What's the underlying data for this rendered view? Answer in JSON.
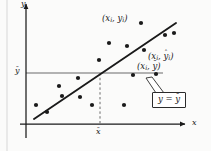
{
  "figure": {
    "kind": "scatterplot-with-regression-line",
    "background": "#fbfbfa",
    "ink": "#1a1a1a",
    "rule_gray": "#9a9a9a"
  },
  "axes": {
    "x_label": "x",
    "y_label": "y",
    "x_tick_label": "x",
    "x_tick_overline": "¯",
    "y_tick_label": "y",
    "y_tick_overline": "¯"
  },
  "annotations": {
    "observed_point": {
      "open": "(",
      "x": "x",
      "xsub": "i",
      "comma": ", ",
      "y": "y",
      "ysub": "i",
      "close": ")"
    },
    "predicted_point": {
      "open": "(",
      "x": "x",
      "xsub": "i",
      "comma": ", ",
      "y": "y",
      "ymark": "ˆ",
      "ysub": "i",
      "close": ")"
    },
    "mean_point": {
      "open": "(",
      "x": "x",
      "xsub": "i",
      "comma": ", ",
      "y": "y",
      "ymark": "¯",
      "close": ")"
    },
    "mean_line_box": {
      "lhs": "y",
      "eq": " = ",
      "rhs": "y",
      "rhs_mark": "¯"
    }
  },
  "chart_data": {
    "type": "scatter",
    "title": "",
    "xlabel": "x",
    "ylabel": "y",
    "grid": false,
    "legend": null,
    "xlim": [
      0,
      211
    ],
    "ylim": [
      0,
      151
    ],
    "note": "Coordinates are in screenshot pixel space; y increases downward.",
    "series": [
      {
        "name": "data points",
        "marker": "filled-circle",
        "color": "#1a1a1a",
        "radius": 2.1,
        "points": [
          [
            36,
            105
          ],
          [
            47,
            112
          ],
          [
            59,
            86
          ],
          [
            62,
            96
          ],
          [
            78,
            78
          ],
          [
            80,
            97
          ],
          [
            92,
            105
          ],
          [
            99,
            60
          ],
          [
            109,
            43
          ],
          [
            124,
            105
          ],
          [
            127,
            46
          ],
          [
            133,
            75
          ],
          [
            141,
            23
          ],
          [
            144,
            50
          ],
          [
            156,
            74
          ],
          [
            165,
            35
          ],
          [
            174,
            33
          ]
        ]
      }
    ],
    "regression_line": {
      "name": "least squares line",
      "color": "#1a1a1a",
      "width": 1.9,
      "x0": 34,
      "y0": 119,
      "x1": 176,
      "y1": 23
    },
    "mean_y_line": {
      "name": "y = y-bar",
      "color": "#9a9a9a",
      "width": 1.6,
      "x0": 26,
      "y0": 73,
      "x1": 163,
      "y1": 73
    },
    "mean_x_line": {
      "name": "x = x-bar (dashed)",
      "color": "#6a6a6a",
      "dash": "2.4 2.4",
      "x": 100,
      "y0": 73,
      "y1": 124
    },
    "axis_x": {
      "x0": 20,
      "y0": 124,
      "x1": 185,
      "y1": 124,
      "arrow": true
    },
    "axis_y": {
      "x0": 26,
      "y0": 138,
      "x1": 26,
      "y1": 4,
      "arrow": true
    },
    "highlight_points": [
      {
        "label": "(x_i, y_i)",
        "x": 141,
        "y": 23
      },
      {
        "label": "(x_i, yhat_i)",
        "x": 144,
        "y": 50
      },
      {
        "label": "(x_i, ybar)",
        "x": 144,
        "y": 73
      }
    ],
    "page_edge_rule": {
      "x": 7,
      "y0": 0,
      "y1": 151,
      "color": "#d7d7d7"
    }
  }
}
